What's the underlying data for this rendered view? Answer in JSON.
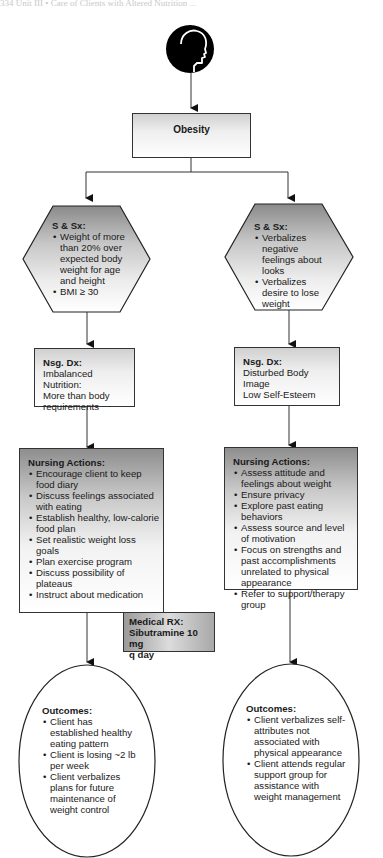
{
  "page_header": "334    Unit III  •  Care of Clients with Altered Nutrition ...",
  "diagram": {
    "root_icon": "head-profile-icon",
    "root": {
      "label": "Obesity"
    },
    "branches": [
      {
        "signs_symptoms": {
          "title": "S & Sx:",
          "items": [
            "Weight of more than 20% over expected body weight for age and height",
            "BMI ≥ 30"
          ]
        },
        "nursing_diagnosis": {
          "title": "Nsg. Dx:",
          "lines": [
            "Imbalanced Nutrition:",
            "More than body",
            "requirements"
          ]
        },
        "nursing_actions": {
          "title": "Nursing Actions:",
          "items": [
            "Encourage client to keep food diary",
            "Discuss feelings associated with eating",
            "Establish healthy, low-calorie food plan",
            "Set realistic weight loss goals",
            "Plan exercise program",
            "Discuss possibility of plateaus",
            "Instruct about medication"
          ]
        },
        "medical_rx": {
          "title": "Medical RX:",
          "lines": [
            "Sibutramine 10 mg",
            "q day"
          ]
        },
        "outcomes": {
          "title": "Outcomes:",
          "items": [
            "Client has established healthy eating pattern",
            "Client is losing ~2 lb per week",
            "Client verbalizes plans for future maintenance of weight control"
          ]
        }
      },
      {
        "signs_symptoms": {
          "title": "S & Sx:",
          "items": [
            "Verbalizes negative feelings about looks",
            "Verbalizes desire to lose weight"
          ]
        },
        "nursing_diagnosis": {
          "title": "Nsg. Dx:",
          "lines": [
            "Disturbed Body Image",
            "Low Self-Esteem"
          ]
        },
        "nursing_actions": {
          "title": "Nursing Actions:",
          "items": [
            "Assess attitude and feelings about weight",
            "Ensure privacy",
            "Explore past eating behaviors",
            "Assess source and level of motivation",
            "Focus on strengths and past accomplishments unrelated to physical appearance",
            "Refer to support/therapy group"
          ]
        },
        "outcomes": {
          "title": "Outcomes:",
          "items": [
            "Client verbalizes self-attributes not associated with physical appearance",
            "Client attends regular support group for assistance with weight management"
          ]
        }
      }
    ]
  }
}
